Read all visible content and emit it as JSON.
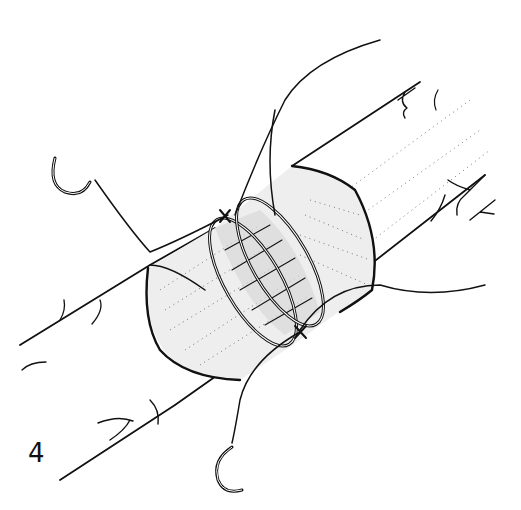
{
  "figure": {
    "panel_label": "4",
    "ink_color": "#111111",
    "shading_color": "#d8d8d8",
    "background": "#ffffff",
    "elements": [
      {
        "name": "vessel-tube",
        "description": "diagonal tubular structure from lower-left to upper-right with branching vein marks"
      },
      {
        "name": "graft-sleeve",
        "description": "stippled sleeve segment wrapping the tube"
      },
      {
        "name": "suture-ring-left",
        "description": "double-line ring around sleeve"
      },
      {
        "name": "suture-ring-right",
        "description": "double-line ring around sleeve"
      },
      {
        "name": "knot-top",
        "description": "X knot at top of left ring"
      },
      {
        "name": "knot-bottom",
        "description": "X knot at bottom of right ring"
      },
      {
        "name": "needle-top-left",
        "description": "curved surgical needle at upper left"
      },
      {
        "name": "needle-bottom",
        "description": "curved surgical needle at bottom"
      },
      {
        "name": "thread-top",
        "description": "free thread ends at top"
      },
      {
        "name": "thread-right",
        "description": "free thread end to the right"
      }
    ]
  }
}
